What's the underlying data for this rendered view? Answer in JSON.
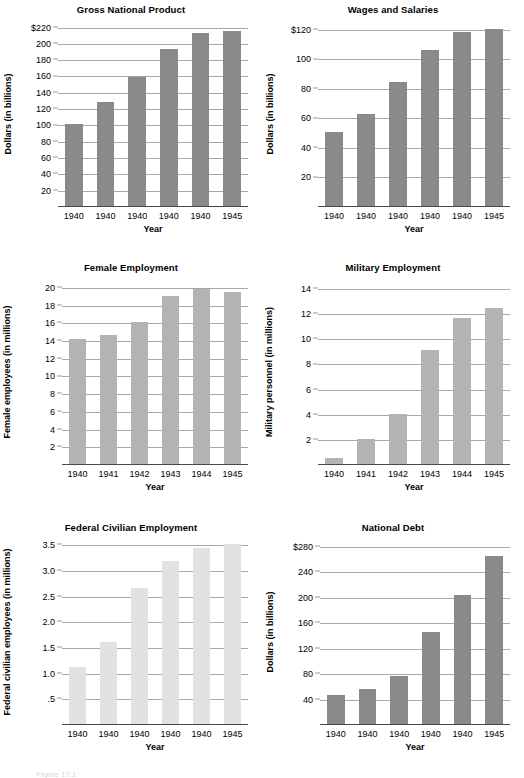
{
  "figure": {
    "caption": "Figure 17.1",
    "panel_count": 6
  },
  "charts": [
    {
      "id": "gross-national-product",
      "chart_data": {
        "type": "bar",
        "title": "Gross National Product",
        "xlabel": "Year",
        "ylabel": "Dollars (in billions)",
        "categories": [
          "1940",
          "1940",
          "1940",
          "1940",
          "1940",
          "1945"
        ],
        "values": [
          100,
          127,
          158,
          193,
          212,
          214
        ],
        "ylim": [
          0,
          228
        ],
        "yticks": [
          20,
          40,
          60,
          80,
          100,
          120,
          140,
          160,
          180,
          200,
          220
        ],
        "yticklabels": [
          "20",
          "40",
          "60",
          "80",
          "100",
          "120",
          "140",
          "160",
          "180",
          "200",
          "$220"
        ],
        "grid": true,
        "legend": "none",
        "bar_color": "#8a8a8a"
      }
    },
    {
      "id": "wages-and-salaries",
      "chart_data": {
        "type": "bar",
        "title": "Wages and Salaries",
        "xlabel": "Year",
        "ylabel": "Dollars (in billions)",
        "categories": [
          "1940",
          "1940",
          "1940",
          "1940",
          "1940",
          "1945"
        ],
        "values": [
          50,
          62,
          84,
          106,
          118,
          120
        ],
        "ylim": [
          0,
          126
        ],
        "yticks": [
          20,
          40,
          60,
          80,
          100,
          120
        ],
        "yticklabels": [
          "20",
          "40",
          "60",
          "80",
          "100",
          "$120"
        ],
        "grid": true,
        "legend": "none",
        "bar_color": "#8a8a8a"
      }
    },
    {
      "id": "female-employment",
      "chart_data": {
        "type": "bar",
        "title": "Female Employment",
        "xlabel": "Year",
        "ylabel": "Female employees (in millions)",
        "categories": [
          "1940",
          "1941",
          "1942",
          "1943",
          "1944",
          "1945"
        ],
        "values": [
          14.1,
          14.6,
          16.0,
          19.0,
          19.8,
          19.4
        ],
        "ylim": [
          0,
          21
        ],
        "yticks": [
          2,
          4,
          6,
          8,
          10,
          12,
          14,
          16,
          18,
          20
        ],
        "yticklabels": [
          "2",
          "4",
          "6",
          "8",
          "10",
          "12",
          "14",
          "16",
          "18",
          "20"
        ],
        "grid": true,
        "legend": "none",
        "bar_color": "#b3b3b3"
      }
    },
    {
      "id": "military-employment",
      "chart_data": {
        "type": "bar",
        "title": "Military Employment",
        "xlabel": "Year",
        "ylabel": "Military personnel (in millions)",
        "categories": [
          "1940",
          "1941",
          "1942",
          "1943",
          "1944",
          "1945"
        ],
        "values": [
          0.5,
          2.0,
          4.0,
          9.1,
          11.6,
          12.4
        ],
        "ylim": [
          0,
          14.8
        ],
        "yticks": [
          2,
          4,
          6,
          8,
          10,
          12,
          14
        ],
        "yticklabels": [
          "2",
          "4",
          "6",
          "8",
          "10",
          "12",
          "14"
        ],
        "grid": true,
        "legend": "none",
        "bar_color": "#b3b3b3"
      }
    },
    {
      "id": "federal-civilian-employment",
      "chart_data": {
        "type": "bar",
        "title": "Federal Civilian Employment",
        "xlabel": "Year",
        "ylabel": "Federal civilian employees (in millions)",
        "categories": [
          "1940",
          "1940",
          "1940",
          "1940",
          "1940",
          "1945"
        ],
        "values": [
          1.1,
          1.6,
          2.65,
          3.17,
          3.43,
          3.5
        ],
        "ylim": [
          0,
          3.62
        ],
        "yticks": [
          0.5,
          1.0,
          1.5,
          2.0,
          2.5,
          3.0,
          3.5
        ],
        "yticklabels": [
          ".5",
          "1.0",
          "1.5",
          "2.0",
          "2.5",
          "3.0",
          "3.5"
        ],
        "grid": true,
        "legend": "none",
        "bar_color": "#e2e2e2"
      }
    },
    {
      "id": "national-debt",
      "chart_data": {
        "type": "bar",
        "title": "National Debt",
        "xlabel": "Year",
        "ylabel": "Dollars (in billions)",
        "categories": [
          "1940",
          "1940",
          "1940",
          "1940",
          "1940",
          "1945"
        ],
        "values": [
          46,
          55,
          75,
          144,
          203,
          263
        ],
        "ylim": [
          0,
          292
        ],
        "yticks": [
          40,
          80,
          120,
          160,
          200,
          240,
          280
        ],
        "yticklabels": [
          "40",
          "80",
          "120",
          "160",
          "200",
          "240",
          "$280"
        ],
        "grid": true,
        "legend": "none",
        "bar_color": "#8a8a8a"
      }
    }
  ]
}
